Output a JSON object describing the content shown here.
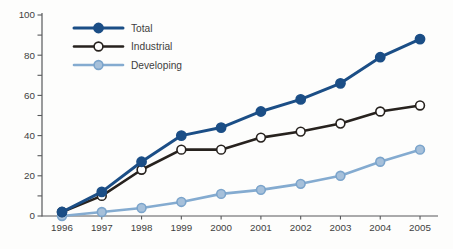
{
  "page": {
    "background": "#fdfdfc"
  },
  "chart_data": {
    "type": "line",
    "title": "",
    "xlabel": "",
    "ylabel": "",
    "x": [
      1996,
      1997,
      1998,
      1999,
      2000,
      2001,
      2002,
      2003,
      2004,
      2005
    ],
    "series": [
      {
        "name": "Total",
        "values": [
          2,
          12,
          27,
          40,
          44,
          52,
          58,
          66,
          79,
          88
        ],
        "line_color": "#1b4e86",
        "line_width": 3,
        "marker_fill": "#1b4e86",
        "marker_stroke": "#1b4e86",
        "marker_radius": 4.6
      },
      {
        "name": "Industrial",
        "values": [
          2,
          10,
          23,
          33,
          33,
          39,
          42,
          46,
          52,
          55
        ],
        "line_color": "#27221e",
        "line_width": 2.6,
        "marker_fill": "#ffffff",
        "marker_stroke": "#27221e",
        "marker_radius": 4.4
      },
      {
        "name": "Developing",
        "values": [
          0,
          2,
          4,
          7,
          11,
          13,
          16,
          20,
          27,
          33
        ],
        "line_color": "#84abd0",
        "line_width": 2.6,
        "marker_fill": "#a6c0da",
        "marker_stroke": "#7ba4cb",
        "marker_radius": 4.4
      }
    ],
    "ylim": [
      0,
      100
    ],
    "y_major_step": 20,
    "y_minor_step": 10,
    "grid": false,
    "legend_position": "top-left",
    "colors": {
      "axis": "#58595b",
      "tick_text": "#3f3f41"
    }
  }
}
